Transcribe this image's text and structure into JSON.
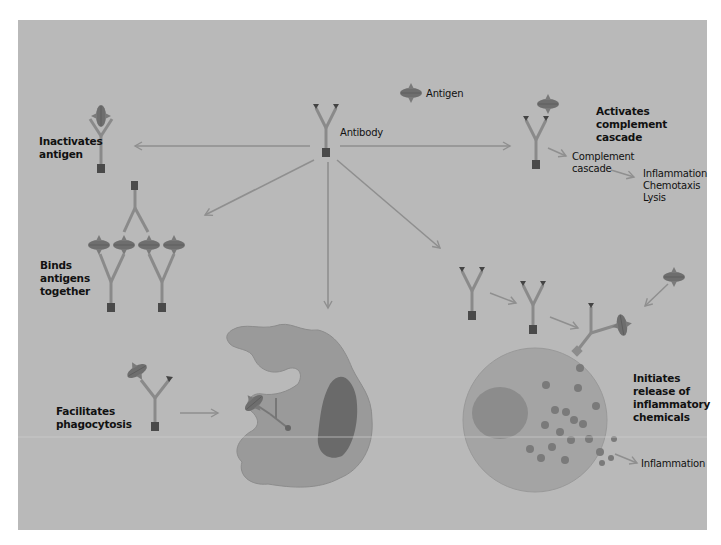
{
  "diagram": {
    "type": "antibody-functions-illustration",
    "center": {
      "label": "Antibody"
    },
    "legend": {
      "antigen_label": "Antigen"
    },
    "functions": [
      {
        "id": "inactivates",
        "label": "Inactivates\nantigen"
      },
      {
        "id": "complement",
        "label": "Activates\ncomplement\ncascade",
        "flow": [
          "Complement\ncascade",
          "Inflammation\nChemotaxis\nLysis"
        ]
      },
      {
        "id": "binds",
        "label": "Binds\nantigens\ntogether"
      },
      {
        "id": "phagocytosis",
        "label": "Facilitates\nphagocytosis"
      },
      {
        "id": "inflammatory",
        "label": "Initiates\nrelease of\ninflammatory\nchemicals",
        "outcome": "Inflammation"
      }
    ],
    "colors": {
      "background": "#b9b9b9",
      "antibody": "#8a8a8a",
      "antibody_base": "#4a4a4a",
      "arrow": "#8f8f8f",
      "antigen": "#6e6e6e",
      "phagocyte": "#9a9a9a",
      "phagocyte_nucleus": "#6a6a6a",
      "mast_cell": "#a4a4a4",
      "mast_nucleus": "#8c8c8c",
      "granule": "#7a7a7a"
    }
  }
}
